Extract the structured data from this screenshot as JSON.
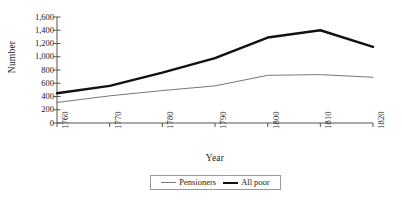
{
  "chart_data": {
    "type": "line",
    "title": "",
    "xlabel": "Year",
    "ylabel": "Number",
    "x": [
      1760,
      1770,
      1780,
      1790,
      1800,
      1810,
      1820
    ],
    "categories": [
      "1760",
      "1770",
      "1780",
      "1790",
      "1800",
      "1810",
      "1820"
    ],
    "xtick_labels": [
      "1760",
      "1770",
      "1780",
      "1790",
      "1800",
      "1810",
      "1820"
    ],
    "ytick_labels": [
      "1,600",
      "1,400",
      "1,200",
      "1,000",
      "800",
      "600",
      "400",
      "200",
      "0"
    ],
    "ytick_values": [
      1600,
      1400,
      1200,
      1000,
      800,
      600,
      400,
      200,
      0
    ],
    "ylim": [
      0,
      1600
    ],
    "xlim": [
      1760,
      1820
    ],
    "grid": false,
    "legend_position": "bottom-center",
    "series": [
      {
        "name": "Pensioners",
        "color": "#777777",
        "width": 1.0,
        "values": [
          310,
          410,
          490,
          560,
          720,
          730,
          690
        ]
      },
      {
        "name": "All poor",
        "color": "#111111",
        "width": 2.4,
        "values": [
          450,
          560,
          760,
          980,
          1290,
          1400,
          1150
        ]
      }
    ]
  },
  "legend": {
    "items": [
      {
        "label": "Pensioners",
        "style": "thin"
      },
      {
        "label": "All poor",
        "style": "thick"
      }
    ]
  }
}
